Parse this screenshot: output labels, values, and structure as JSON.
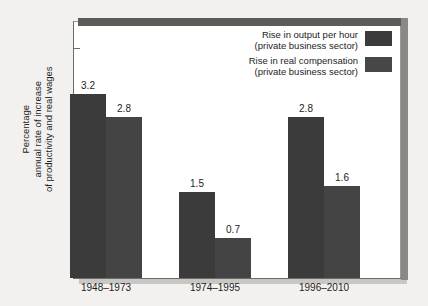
{
  "chart_data": {
    "type": "bar",
    "title": "",
    "subtitle": "",
    "xlabel": "",
    "ylabel": "Percentage\nannual rate of increase\nof productivity and real wages",
    "categories": [
      "1948–1973",
      "1974–1995",
      "1996–2010"
    ],
    "series": [
      {
        "name": "Rise in output per hour\n(private business sector)",
        "color": "#3b3b3b",
        "values": [
          3.2,
          2.8,
          2.8
        ],
        "value_labels": [
          "3.2",
          "1.5",
          "2.8"
        ]
      },
      {
        "name": "Rise in real compensation\n(private business sector)",
        "color": "#474747",
        "values": [
          2.8,
          0.7,
          1.6
        ],
        "value_labels": [
          "2.8",
          "0.7",
          "1.6"
        ]
      }
    ],
    "series_values": [
      [
        3.2,
        1.5,
        2.8
      ],
      [
        2.8,
        0.7,
        1.6
      ]
    ],
    "ylim": [
      0,
      4.5
    ],
    "yticks": [
      0,
      1,
      2,
      3,
      4
    ],
    "ytick_labels": [
      "0",
      "1",
      "2",
      "3",
      "4"
    ],
    "grid": false,
    "legend_position": "top-right",
    "background_color": "#f2f1ef",
    "plot_background_color": "#ffffff",
    "axis_color": "#6e6c69"
  },
  "axis": {
    "y_title_line1": "Percentage",
    "y_title_line2": "annual rate of increase",
    "y_title_line3": "of productivity and real wages",
    "tick_0": "0",
    "tick_1": "1",
    "tick_2": "2",
    "tick_3": "3",
    "tick_4": "4"
  },
  "categories": {
    "c0": "1948–1973",
    "c1": "1974–1995",
    "c2": "1996–2010"
  },
  "legend": {
    "items": [
      {
        "label": "Rise in output per hour\n(private business sector)"
      },
      {
        "label": "Rise in real compensation\n(private business sector)"
      }
    ]
  },
  "labels": {
    "g0s0": "3.2",
    "g0s1": "2.8",
    "g1s0": "1.5",
    "g1s1": "0.7",
    "g2s0": "2.8",
    "g2s1": "1.6"
  }
}
